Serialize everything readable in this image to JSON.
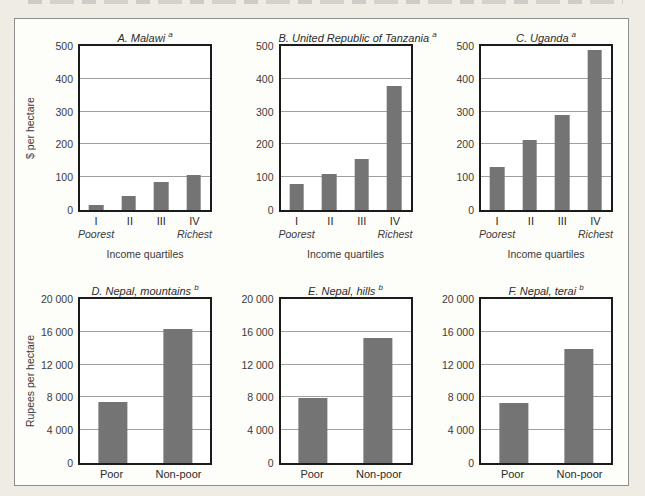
{
  "page": {
    "background": "#efece4",
    "panel_background": "#fdfdfa",
    "panel_border": "#8f8f8f"
  },
  "colors": {
    "bar": "#747474",
    "gridline": "#a0a0a0",
    "plot_frame": "#1b1b1b",
    "text": "#2b2b2b"
  },
  "chart_data": [
    {
      "id": "A",
      "type": "bar",
      "title": "A. Malawi",
      "footnote_mark": "a",
      "ylabel": "$ per hectare",
      "xlabel": "Income quartiles",
      "categories": [
        "I",
        "II",
        "III",
        "IV"
      ],
      "category_sub_labels": {
        "first": "Poorest",
        "last": "Richest"
      },
      "values": [
        15,
        42,
        85,
        108
      ],
      "ylim": [
        0,
        500
      ],
      "yticks": [
        0,
        100,
        200,
        300,
        400,
        500
      ],
      "ytick_labels": [
        "0",
        "100",
        "200",
        "300",
        "400",
        "500"
      ],
      "grid": "horizontal",
      "legend": "none"
    },
    {
      "id": "B",
      "type": "bar",
      "title": "B. United Republic of Tanzania",
      "footnote_mark": "a",
      "ylabel": "",
      "xlabel": "Income quartiles",
      "categories": [
        "I",
        "II",
        "III",
        "IV"
      ],
      "category_sub_labels": {
        "first": "Poorest",
        "last": "Richest"
      },
      "values": [
        80,
        110,
        155,
        378
      ],
      "ylim": [
        0,
        500
      ],
      "yticks": [
        0,
        100,
        200,
        300,
        400,
        500
      ],
      "ytick_labels": [
        "0",
        "100",
        "200",
        "300",
        "400",
        "500"
      ],
      "grid": "horizontal",
      "legend": "none"
    },
    {
      "id": "C",
      "type": "bar",
      "title": "C. Uganda",
      "footnote_mark": "a",
      "ylabel": "",
      "xlabel": "Income quartiles",
      "categories": [
        "I",
        "II",
        "III",
        "IV"
      ],
      "category_sub_labels": {
        "first": "Poorest",
        "last": "Richest"
      },
      "values": [
        130,
        213,
        291,
        489
      ],
      "ylim": [
        0,
        500
      ],
      "yticks": [
        0,
        100,
        200,
        300,
        400,
        500
      ],
      "ytick_labels": [
        "0",
        "100",
        "200",
        "300",
        "400",
        "500"
      ],
      "grid": "horizontal",
      "legend": "none"
    },
    {
      "id": "D",
      "type": "bar",
      "title": "D. Nepal, mountains",
      "footnote_mark": "b",
      "ylabel": "Rupees per hectare",
      "xlabel": "",
      "categories": [
        "Poor",
        "Non-poor"
      ],
      "category_sub_labels": null,
      "values": [
        7500,
        16400
      ],
      "ylim": [
        0,
        20000
      ],
      "yticks": [
        0,
        4000,
        8000,
        12000,
        16000,
        20000
      ],
      "ytick_labels": [
        "0",
        "4 000",
        "8 000",
        "12 000",
        "16 000",
        "20 000"
      ],
      "grid": "horizontal",
      "legend": "none"
    },
    {
      "id": "E",
      "type": "bar",
      "title": "E. Nepal, hills",
      "footnote_mark": "b",
      "ylabel": "",
      "xlabel": "",
      "categories": [
        "Poor",
        "Non-poor"
      ],
      "category_sub_labels": null,
      "values": [
        7900,
        15300
      ],
      "ylim": [
        0,
        20000
      ],
      "yticks": [
        0,
        4000,
        8000,
        12000,
        16000,
        20000
      ],
      "ytick_labels": [
        "0",
        "4 000",
        "8 000",
        "12 000",
        "16 000",
        "20 000"
      ],
      "grid": "horizontal",
      "legend": "none"
    },
    {
      "id": "F",
      "type": "bar",
      "title": "F. Nepal, terai",
      "footnote_mark": "b",
      "ylabel": "",
      "xlabel": "",
      "categories": [
        "Poor",
        "Non-poor"
      ],
      "category_sub_labels": null,
      "values": [
        7300,
        13900
      ],
      "ylim": [
        0,
        20000
      ],
      "yticks": [
        0,
        4000,
        8000,
        12000,
        16000,
        20000
      ],
      "ytick_labels": [
        "0",
        "4 000",
        "8 000",
        "12 000",
        "16 000",
        "20 000"
      ],
      "grid": "horizontal",
      "legend": "none"
    }
  ]
}
